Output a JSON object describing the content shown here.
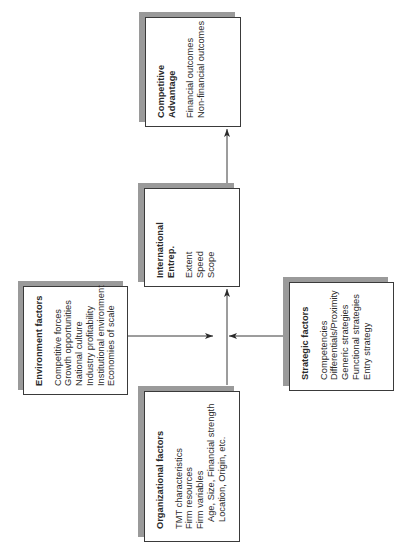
{
  "diagram": {
    "boxes": {
      "competitive_advantage": {
        "title_line1": "Competitive",
        "title_line2": "Advantage",
        "items": [
          "Financial outcomes",
          "Non-financial outcomes"
        ]
      },
      "international_entrep": {
        "title_line1": "International",
        "title_line2": "Entrep.",
        "items": [
          "Extent",
          "Speed",
          "Scope"
        ]
      },
      "environment_factors": {
        "title": "Environment factors",
        "items": [
          "Competitive forces",
          "Growth opportunities",
          "National culture",
          "Industry profitability",
          "Institutional environment",
          "Economies of scale"
        ]
      },
      "strategic_factors": {
        "title": "Strategic factors",
        "items": [
          "Competencies",
          "Differentials/Proximity",
          "Generic strategies",
          "Functional strategies",
          "Entry strategy"
        ]
      },
      "organizational_factors": {
        "title": "Organizational factors",
        "items": [
          "TMT characteristics",
          "Firm resources",
          "Firm variables"
        ],
        "sub_items": [
          "Age, Size, Financial strength",
          "Location, Origin, etc."
        ]
      }
    },
    "connections": [
      {
        "from": "environment_factors",
        "to": "international_entrep"
      },
      {
        "from": "strategic_factors",
        "to": "international_entrep"
      },
      {
        "from": "organizational_factors",
        "to": "international_entrep"
      },
      {
        "from": "international_entrep",
        "to": "competitive_advantage"
      }
    ],
    "colors": {
      "shadow": "#9a9a9a",
      "border": "#3a3a3a",
      "text": "#2a2a2a"
    },
    "orientation": "rotated -90deg (text reads bottom-to-top)"
  }
}
